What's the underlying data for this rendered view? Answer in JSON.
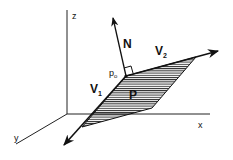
{
  "diagram": {
    "title": "",
    "colors": {
      "ink": "#111111",
      "background": "#ffffff"
    },
    "axes": {
      "z": {
        "label": "z"
      },
      "x": {
        "label": "x"
      },
      "y": {
        "label": "y"
      }
    },
    "vectors": {
      "normal": {
        "label": "N"
      },
      "v1": {
        "label": "V",
        "subscript": "1"
      },
      "v2": {
        "label": "V",
        "subscript": "2"
      }
    },
    "point": {
      "label": "p",
      "subscript": "o"
    },
    "plane": {
      "label": "P",
      "fill": "hatched"
    },
    "right_angle_marker": true
  }
}
